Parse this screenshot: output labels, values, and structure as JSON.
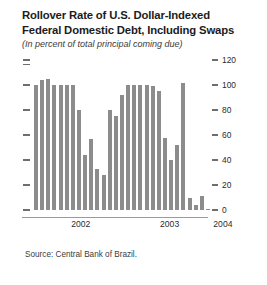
{
  "figure": {
    "title_line1": "Rollover Rate of U.S. Dollar-Indexed",
    "title_line2": "Federal Domestic Debt, Including Swaps",
    "subtitle": "(In percent of total principal coming due)",
    "source": "Source: Central Bank of Brazil.",
    "bar_color": "#8c8c8c",
    "axis_color": "#6e6e6e",
    "background": "#ffffff"
  },
  "chart_data": {
    "type": "bar",
    "title": "Rollover Rate of U.S. Dollar-Indexed Federal Domestic Debt, Including Swaps",
    "subtitle": "(In percent of total principal coming due)",
    "xlabel": "",
    "ylabel": "In percent of total principal coming due",
    "ylim": [
      0,
      120
    ],
    "yticks": [
      0,
      20,
      40,
      60,
      80,
      100,
      120
    ],
    "ytick_labels": [
      "0",
      "20",
      "40",
      "60",
      "80",
      "100",
      "120"
    ],
    "grid": false,
    "legend": "none",
    "axis_position": "right",
    "categories": [
      "2001-11",
      "2001-12",
      "2002-01",
      "2002-02",
      "2002-03",
      "2002-04",
      "2002-05",
      "2002-06",
      "2002-07",
      "2002-08",
      "2002-09",
      "2002-10",
      "2002-11",
      "2002-12",
      "2003-01",
      "2003-02",
      "2003-03",
      "2003-04",
      "2003-05",
      "2003-06",
      "2003-07",
      "2003-08",
      "2003-09",
      "2003-10",
      "2003-11",
      "2003-12",
      "2004-01",
      "2004-02",
      "2004-03"
    ],
    "values": [
      100,
      104,
      105,
      100,
      100,
      100,
      100,
      80,
      44,
      57,
      33,
      28,
      80,
      75,
      92,
      100,
      100,
      100,
      100,
      99,
      95,
      58,
      40,
      52,
      102,
      10,
      4,
      11,
      1
    ],
    "xtick_labels": [
      "2002",
      "2003",
      "2004"
    ],
    "xtick_positions_pct": [
      26.5,
      66.5,
      90.5
    ],
    "series": [
      {
        "name": "Rollover rate",
        "values": [
          100,
          104,
          105,
          100,
          100,
          100,
          100,
          80,
          44,
          57,
          33,
          28,
          80,
          75,
          92,
          100,
          100,
          100,
          100,
          99,
          95,
          58,
          40,
          52,
          102,
          10,
          4,
          11,
          1
        ]
      }
    ]
  }
}
